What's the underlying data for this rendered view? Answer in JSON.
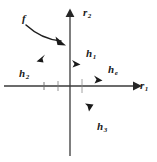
{
  "figure": {
    "name": "vector-diagram-r1-r2",
    "background_color": "#ffffff",
    "ink_color": "#1f1f1f",
    "width": 157,
    "height": 162
  },
  "axes": {
    "horizontal": {
      "label_base": "r",
      "label_sub": "1",
      "icon": "axis-arrow-right-icon",
      "y": 86,
      "x_start": 4,
      "x_end": 141
    },
    "vertical": {
      "label_base": "r",
      "label_sub": "2",
      "icon": "axis-arrow-up-icon",
      "x": 70,
      "y_start": 9,
      "y_end": 156
    },
    "origin": {
      "x": 70,
      "y": 86
    }
  },
  "vectors": [
    {
      "id": "h1",
      "label_base": "h",
      "label_sub": "1",
      "icon": "vector-arrowhead-icon",
      "tip_x": 79,
      "tip_y": 64,
      "angle_deg": 25
    },
    {
      "id": "h2",
      "label_base": "h",
      "label_sub": "2",
      "icon": "vector-arrowhead-icon",
      "tip_x": 38,
      "tip_y": 60,
      "angle_deg": 205
    },
    {
      "id": "he",
      "label_base": "h",
      "label_sub": "e",
      "icon": "vector-arrowhead-icon",
      "tip_x": 100,
      "tip_y": 80,
      "angle_deg": 10
    },
    {
      "id": "h3",
      "label_base": "h",
      "label_sub": "3",
      "icon": "vector-arrowhead-icon",
      "tip_x": 89,
      "tip_y": 109,
      "angle_deg": 110
    }
  ],
  "annotation": {
    "id": "f",
    "label_base": "f",
    "label_sub": "",
    "icon": "curved-arrow-icon",
    "curve_start_x": 26,
    "curve_start_y": 24,
    "curve_end_x": 64,
    "curve_end_y": 44
  },
  "ticks": {
    "horizontal": [
      44,
      58,
      82
    ],
    "vertical": []
  }
}
